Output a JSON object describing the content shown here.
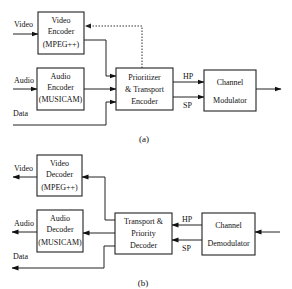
{
  "figure_a": {
    "caption": "(a)",
    "inputs": {
      "video": "Video",
      "audio": "Audio",
      "data": "Data"
    },
    "video_encoder": {
      "line1": "Video",
      "line2": "Encoder",
      "line3": "(MPEG++)"
    },
    "audio_encoder": {
      "line1": "Audio",
      "line2": "Encoder",
      "line3": "(MUSICAM)"
    },
    "prioritizer": {
      "line1": "Prioritizer",
      "line2": "& Transport",
      "line3": "Encoder"
    },
    "modulator": {
      "line1": "Channel",
      "line2": "Modulator"
    },
    "hp_label": "HP",
    "sp_label": "SP"
  },
  "figure_b": {
    "caption": "(b)",
    "outputs": {
      "video": "Video",
      "audio": "Audio",
      "data": "Data"
    },
    "video_decoder": {
      "line1": "Video",
      "line2": "Decoder",
      "line3": "(MPEG++)"
    },
    "audio_decoder": {
      "line1": "Audio",
      "line2": "Decoder",
      "line3": "(MUSICAM)"
    },
    "transport_decoder": {
      "line1": "Transport &",
      "line2": "Priority",
      "line3": "Decoder"
    },
    "demodulator": {
      "line1": "Channel",
      "line2": "Demodulator"
    },
    "hp_label": "HP",
    "sp_label": "SP"
  }
}
